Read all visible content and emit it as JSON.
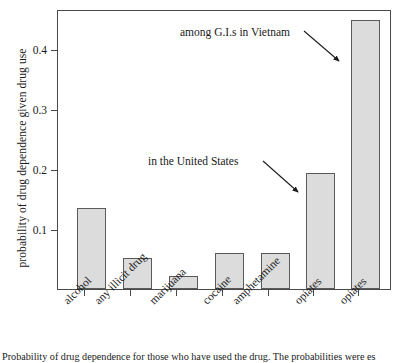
{
  "chart_data": {
    "type": "bar",
    "title": "",
    "xlabel": "",
    "ylabel": "probability of drug dependence given drug use",
    "categories": [
      "alcohol",
      "any illicit drug",
      "marijuana",
      "cocaine",
      "amphetamine",
      "opiates",
      "opiates"
    ],
    "values": [
      0.14,
      0.053,
      0.023,
      0.062,
      0.063,
      0.2,
      0.465
    ],
    "ylim": [
      0,
      0.4833
    ],
    "yticks": [
      0.1,
      0.2,
      0.3,
      0.4
    ],
    "ytick_labels": [
      "0.1",
      "0.2",
      "0.3",
      "0.4"
    ],
    "grid": false,
    "legend": "none",
    "bar_fill": "#dcdcdc",
    "bar_edge": "#5a5a5a",
    "annotations": [
      {
        "text": "among G.I.s in Vietnam",
        "points_to": "opiates (7th bar)"
      },
      {
        "text": "in the United States",
        "points_to": "opiates (6th bar)"
      }
    ]
  },
  "axis": {
    "y_title": "probability of drug dependence given drug use",
    "y_ticks": [
      "0.4",
      "0.3",
      "0.2",
      "0.1"
    ],
    "x_labels": [
      "alcohol",
      "any illicit drug",
      "marijuana",
      "cocaine",
      "amphetamine",
      "opiates",
      "opiates"
    ]
  },
  "annotations": {
    "vietnam": "among G.I.s in Vietnam",
    "united_states": "in the United States"
  },
  "caption": {
    "text": "Probability of drug dependence for those who have used the drug. The probabilities were es"
  }
}
